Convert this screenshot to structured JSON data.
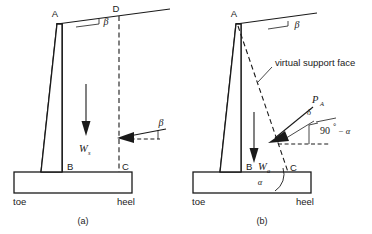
{
  "figure": {
    "background_color": "#ffffff",
    "line_color": "#1a1a1a",
    "panels": [
      {
        "caption": "(a)",
        "description": "Cantilever retaining wall with vertical virtual back face B-C-D",
        "points": [
          {
            "label": "A",
            "role": "top-of-stem-back"
          },
          {
            "label": "D",
            "role": "top-of-virtual-plane-at-backfill-surface"
          },
          {
            "label": "B",
            "role": "bottom-of-stem-back"
          },
          {
            "label": "C",
            "role": "heel-top"
          }
        ],
        "angles": [
          {
            "symbol": "β",
            "role": "backfill-slope-angle-at-surface"
          },
          {
            "symbol": "β",
            "role": "earth-pressure-inclination-at-virtual-face"
          }
        ],
        "forces": [
          {
            "symbol": "W",
            "subscript": "s",
            "role": "weight-of-soil-wedge",
            "direction": "down"
          },
          {
            "symbol": "",
            "role": "earth-pressure-resultant-arrow",
            "direction": "left"
          }
        ],
        "base_labels": {
          "left": "toe",
          "right": "heel"
        }
      },
      {
        "caption": "(b)",
        "description": "Cantilever retaining wall with inclined virtual support face A-C",
        "points": [
          {
            "label": "A",
            "role": "top-of-stem-back"
          },
          {
            "label": "B",
            "role": "bottom-of-stem-back"
          },
          {
            "label": "C",
            "role": "heel-top"
          }
        ],
        "callout": "virtual support face",
        "angles": [
          {
            "symbol": "β",
            "role": "backfill-slope-angle-at-surface"
          },
          {
            "symbol": "δ",
            "role": "wall-friction-angle-on-virtual-face"
          },
          {
            "symbol": "90° − α",
            "role": "inclination-of-virtual-face-normal-from-horizontal"
          },
          {
            "symbol": "α",
            "role": "angle-between-base-and-virtual-support-face"
          }
        ],
        "forces": [
          {
            "symbol": "W",
            "subscript": "a",
            "role": "weight-of-soil-wedge",
            "direction": "down"
          },
          {
            "symbol": "P",
            "subscript": "A",
            "role": "active-earth-pressure-resultant",
            "direction": "down-left"
          }
        ],
        "base_labels": {
          "left": "toe",
          "right": "heel"
        }
      }
    ],
    "text": {
      "a_caption": "(a)",
      "b_caption": "(b)",
      "pt_A_a": "A",
      "pt_D_a": "D",
      "pt_B_a": "B",
      "pt_C_a": "C",
      "pt_A_b": "A",
      "pt_B_b": "B",
      "pt_C_b": "C",
      "toe_a": "toe",
      "heel_a": "heel",
      "toe_b": "toe",
      "heel_b": "heel",
      "beta_a_top": "β",
      "beta_a_force": "β",
      "beta_b_top": "β",
      "alpha_b_base": "α",
      "delta_b": "δ",
      "ninety_minus_alpha": "90",
      "ninety_deg_mark": "°",
      "minus_alpha": "− α",
      "virtual_support_face": "virtual support face",
      "W_letter_a": "W",
      "W_sub_a": "s",
      "W_letter_b": "W",
      "W_sub_b": "a",
      "P_letter": "P",
      "P_sub": "A"
    }
  }
}
